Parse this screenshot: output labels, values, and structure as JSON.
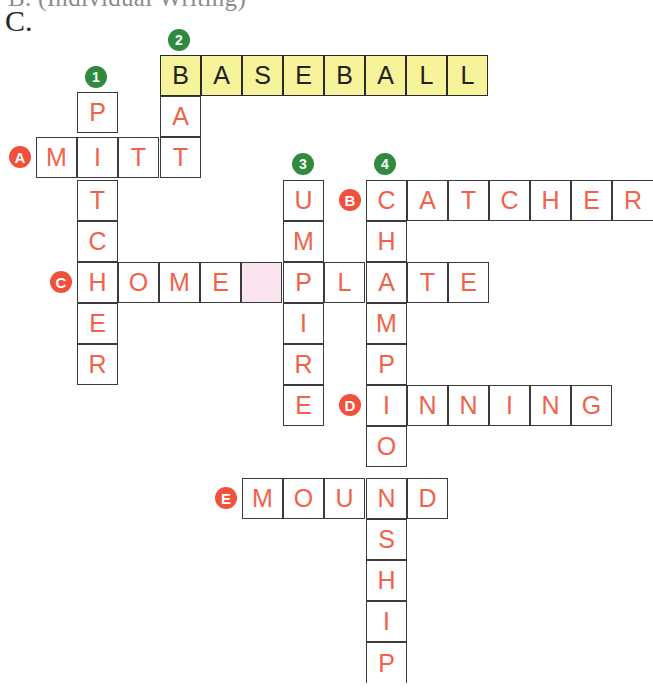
{
  "page": {
    "clipped_heading": "B.  (Individual Writing)",
    "section_label": "C."
  },
  "colors": {
    "letter": "#f0634a",
    "theme_fill": "#f7f39a",
    "theme_letter": "#23211c",
    "blank_fill": "#f9e3ef",
    "grid_line": "#3b3b3b",
    "number_marker": "#2f8a3e",
    "letter_marker": "#f0503c"
  },
  "grid": {
    "cell_size": 41,
    "origin_x": 36,
    "origin_y": 55,
    "note": "col index = (x-36)/41, row index = (y-55)/41"
  },
  "entries": [
    {
      "id": "across-2-baseball",
      "number": "2",
      "direction": "across",
      "answer": "BASEBALL",
      "theme": true,
      "row": 0,
      "col": 3,
      "letters": [
        "B",
        "A",
        "S",
        "E",
        "B",
        "A",
        "L",
        "L"
      ]
    },
    {
      "id": "down-1-pitcher",
      "number": "1",
      "direction": "down",
      "answer": "PITCHER",
      "theme": false,
      "row": 1,
      "col": 1,
      "letters": [
        "P",
        "I",
        "T",
        "C",
        "H",
        "E",
        "R"
      ]
    },
    {
      "id": "down-2-bat",
      "number": "2",
      "direction": "down",
      "answer": "BAT",
      "theme": false,
      "row": 0,
      "col": 3,
      "letters": [
        "B",
        "A",
        "T"
      ],
      "rendered_letters": [
        "A",
        "T"
      ]
    },
    {
      "id": "across-a-mitt",
      "letter": "A",
      "direction": "across",
      "answer": "MITT",
      "theme": false,
      "row": 2,
      "col": 0,
      "letters": [
        "M",
        "I",
        "T",
        "T"
      ]
    },
    {
      "id": "down-3-umpire",
      "number": "3",
      "direction": "down",
      "answer": "UMPIRE",
      "theme": false,
      "row": 3,
      "col": 6,
      "letters": [
        "U",
        "M",
        "P",
        "I",
        "R",
        "E"
      ]
    },
    {
      "id": "down-4-championship",
      "number": "4",
      "direction": "down",
      "answer": "CHAMPIONSHIP",
      "theme": false,
      "row": 3,
      "col": 8,
      "letters": [
        "C",
        "H",
        "A",
        "M",
        "P",
        "I",
        "O",
        "N",
        "S",
        "H",
        "I",
        "P"
      ]
    },
    {
      "id": "across-b-catcher",
      "letter": "B",
      "direction": "across",
      "answer": "CATCHER",
      "theme": false,
      "row": 3,
      "col": 8,
      "letters": [
        "C",
        "A",
        "T",
        "C",
        "H",
        "E",
        "R"
      ]
    },
    {
      "id": "across-c-homeplate",
      "letter": "C",
      "direction": "across",
      "answer": "HOME PLATE",
      "theme": false,
      "row": 5,
      "col": 1,
      "letters": [
        "H",
        "O",
        "M",
        "E",
        " ",
        "P",
        "L",
        "A",
        "T",
        "E"
      ],
      "blank_index": 4
    },
    {
      "id": "across-d-inning",
      "letter": "D",
      "direction": "across",
      "answer": "INNING",
      "theme": false,
      "row": 8,
      "col": 8,
      "letters": [
        "I",
        "N",
        "N",
        "I",
        "N",
        "G"
      ]
    },
    {
      "id": "across-e-mound",
      "letter": "E",
      "direction": "across",
      "answer": "MOUND",
      "theme": false,
      "row": 10,
      "col": 5,
      "letters": [
        "M",
        "O",
        "U",
        "N",
        "D"
      ]
    }
  ],
  "cells": [
    {
      "name": "cell-baseball-b",
      "x": 160,
      "y": 55,
      "text": "B",
      "theme": true
    },
    {
      "name": "cell-baseball-a1",
      "x": 201,
      "y": 55,
      "text": "A",
      "theme": true
    },
    {
      "name": "cell-baseball-s",
      "x": 242,
      "y": 55,
      "text": "S",
      "theme": true
    },
    {
      "name": "cell-baseball-e",
      "x": 283,
      "y": 55,
      "text": "E",
      "theme": true
    },
    {
      "name": "cell-baseball-b2",
      "x": 324,
      "y": 55,
      "text": "B",
      "theme": true
    },
    {
      "name": "cell-baseball-a2",
      "x": 365,
      "y": 55,
      "text": "A",
      "theme": true
    },
    {
      "name": "cell-baseball-l1",
      "x": 406,
      "y": 55,
      "text": "L",
      "theme": true
    },
    {
      "name": "cell-baseball-l2",
      "x": 447,
      "y": 55,
      "text": "L",
      "theme": true
    },
    {
      "name": "cell-pitcher-p",
      "x": 77,
      "y": 92,
      "text": "P"
    },
    {
      "name": "cell-bat-a",
      "x": 160,
      "y": 96,
      "text": "A"
    },
    {
      "name": "cell-mitt-m",
      "x": 36,
      "y": 137,
      "text": "M"
    },
    {
      "name": "cell-pitcher-i",
      "x": 77,
      "y": 137,
      "text": "I"
    },
    {
      "name": "cell-mitt-t1",
      "x": 118,
      "y": 137,
      "text": "T"
    },
    {
      "name": "cell-bat-t",
      "x": 160,
      "y": 137,
      "text": "T"
    },
    {
      "name": "cell-pitcher-t",
      "x": 77,
      "y": 180,
      "text": "T"
    },
    {
      "name": "cell-umpire-u",
      "x": 283,
      "y": 180,
      "text": "U"
    },
    {
      "name": "cell-catcher-c",
      "x": 366,
      "y": 180,
      "text": "C"
    },
    {
      "name": "cell-catcher-a",
      "x": 407,
      "y": 180,
      "text": "A"
    },
    {
      "name": "cell-catcher-t",
      "x": 448,
      "y": 180,
      "text": "T"
    },
    {
      "name": "cell-catcher-c2",
      "x": 489,
      "y": 180,
      "text": "C"
    },
    {
      "name": "cell-catcher-h",
      "x": 530,
      "y": 180,
      "text": "H"
    },
    {
      "name": "cell-catcher-e",
      "x": 571,
      "y": 180,
      "text": "E"
    },
    {
      "name": "cell-catcher-r",
      "x": 612,
      "y": 180,
      "text": "R",
      "clipRight": true
    },
    {
      "name": "cell-pitcher-c",
      "x": 77,
      "y": 221,
      "text": "C"
    },
    {
      "name": "cell-umpire-m",
      "x": 283,
      "y": 221,
      "text": "M"
    },
    {
      "name": "cell-championship-h",
      "x": 366,
      "y": 221,
      "text": "H"
    },
    {
      "name": "cell-home-h",
      "x": 77,
      "y": 262,
      "text": "H"
    },
    {
      "name": "cell-home-o",
      "x": 118,
      "y": 262,
      "text": "O"
    },
    {
      "name": "cell-home-m",
      "x": 159,
      "y": 262,
      "text": "M"
    },
    {
      "name": "cell-home-e",
      "x": 200,
      "y": 262,
      "text": "E"
    },
    {
      "name": "cell-home-space",
      "x": 241,
      "y": 262,
      "text": "",
      "blank": true
    },
    {
      "name": "cell-plate-p",
      "x": 283,
      "y": 262,
      "text": "P"
    },
    {
      "name": "cell-plate-l",
      "x": 324,
      "y": 262,
      "text": "L"
    },
    {
      "name": "cell-plate-a",
      "x": 366,
      "y": 262,
      "text": "A"
    },
    {
      "name": "cell-plate-t",
      "x": 407,
      "y": 262,
      "text": "T"
    },
    {
      "name": "cell-plate-e",
      "x": 448,
      "y": 262,
      "text": "E"
    },
    {
      "name": "cell-pitcher-h",
      "x": 77,
      "y": 303,
      "text": "E"
    },
    {
      "name": "cell-umpire-i",
      "x": 283,
      "y": 303,
      "text": "I"
    },
    {
      "name": "cell-championship-m",
      "x": 366,
      "y": 303,
      "text": "M"
    },
    {
      "name": "cell-pitcher-r",
      "x": 77,
      "y": 344,
      "text": "R"
    },
    {
      "name": "cell-umpire-r",
      "x": 283,
      "y": 344,
      "text": "R"
    },
    {
      "name": "cell-championship-p",
      "x": 366,
      "y": 344,
      "text": "P"
    },
    {
      "name": "cell-umpire-e",
      "x": 283,
      "y": 385,
      "text": "E"
    },
    {
      "name": "cell-inning-i",
      "x": 366,
      "y": 385,
      "text": "I"
    },
    {
      "name": "cell-inning-n1",
      "x": 407,
      "y": 385,
      "text": "N"
    },
    {
      "name": "cell-inning-n2",
      "x": 448,
      "y": 385,
      "text": "N"
    },
    {
      "name": "cell-inning-i2",
      "x": 489,
      "y": 385,
      "text": "I"
    },
    {
      "name": "cell-inning-n3",
      "x": 530,
      "y": 385,
      "text": "N"
    },
    {
      "name": "cell-inning-g",
      "x": 571,
      "y": 385,
      "text": "G"
    },
    {
      "name": "cell-championship-o",
      "x": 366,
      "y": 426,
      "text": "O"
    },
    {
      "name": "cell-mound-m",
      "x": 242,
      "y": 478,
      "text": "M"
    },
    {
      "name": "cell-mound-o",
      "x": 283,
      "y": 478,
      "text": "O"
    },
    {
      "name": "cell-mound-u",
      "x": 324,
      "y": 478,
      "text": "U"
    },
    {
      "name": "cell-mound-n",
      "x": 366,
      "y": 478,
      "text": "N"
    },
    {
      "name": "cell-mound-d",
      "x": 407,
      "y": 478,
      "text": "D"
    },
    {
      "name": "cell-championship-s",
      "x": 366,
      "y": 519,
      "text": "S"
    },
    {
      "name": "cell-championship-h2",
      "x": 366,
      "y": 560,
      "text": "H"
    },
    {
      "name": "cell-championship-i",
      "x": 366,
      "y": 601,
      "text": "I"
    },
    {
      "name": "cell-championship-p2",
      "x": 366,
      "y": 642,
      "text": "P",
      "clipBottom": true
    }
  ],
  "markers": [
    {
      "name": "clue-marker-1",
      "text": "1",
      "kind": "num",
      "x": 85,
      "y": 66
    },
    {
      "name": "clue-marker-2",
      "text": "2",
      "kind": "num",
      "x": 168,
      "y": 29
    },
    {
      "name": "clue-marker-3",
      "text": "3",
      "kind": "num",
      "x": 292,
      "y": 153
    },
    {
      "name": "clue-marker-4",
      "text": "4",
      "kind": "num",
      "x": 374,
      "y": 153
    },
    {
      "name": "clue-marker-a",
      "text": "A",
      "kind": "alpha",
      "x": 9,
      "y": 146
    },
    {
      "name": "clue-marker-b",
      "text": "B",
      "kind": "alpha",
      "x": 339,
      "y": 189
    },
    {
      "name": "clue-marker-c",
      "text": "C",
      "kind": "alpha",
      "x": 50,
      "y": 271
    },
    {
      "name": "clue-marker-d",
      "text": "D",
      "kind": "alpha",
      "x": 339,
      "y": 394
    },
    {
      "name": "clue-marker-e",
      "text": "E",
      "kind": "alpha",
      "x": 215,
      "y": 487
    }
  ]
}
